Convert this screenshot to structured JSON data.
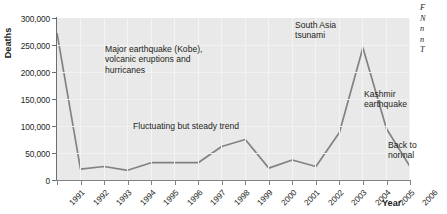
{
  "chart_data": {
    "type": "line",
    "title": "",
    "xlabel": "Year",
    "ylabel": "Deaths",
    "x": [
      1991,
      1992,
      1993,
      1994,
      1995,
      1996,
      1997,
      1998,
      1999,
      2000,
      2001,
      2002,
      2003,
      2004,
      2005,
      2006
    ],
    "categories": [
      "1991",
      "1992",
      "1993",
      "1994",
      "1995",
      "1996",
      "1997",
      "1998",
      "1999",
      "2000",
      "2001",
      "2002",
      "2003",
      "2004",
      "2005",
      "2006"
    ],
    "values": [
      272000,
      20000,
      25000,
      18000,
      32000,
      32000,
      32000,
      62000,
      75000,
      22000,
      37000,
      25000,
      88000,
      245000,
      95000,
      25000
    ],
    "ylim": [
      0,
      300000
    ],
    "yticks": [
      0,
      50000,
      100000,
      150000,
      200000,
      250000,
      300000
    ],
    "ytick_labels": [
      "0",
      "50,000",
      "100,000",
      "150,000",
      "200,000",
      "250,000",
      "300,000"
    ],
    "grid": true,
    "legend": "none",
    "series": [
      {
        "name": "Deaths",
        "color": "#808285",
        "values": [
          272000,
          20000,
          25000,
          18000,
          32000,
          32000,
          32000,
          62000,
          75000,
          22000,
          37000,
          25000,
          88000,
          245000,
          95000,
          25000
        ]
      }
    ],
    "annotations": [
      {
        "id": "kobe",
        "text": "Major earthquake (Kobe),\nvolcanic eruptions and\nhurricanes",
        "points_to": 1991
      },
      {
        "id": "fluctuating",
        "text": "Fluctuating but steady trend",
        "points_to": null
      },
      {
        "id": "tsunami",
        "text": "South Asia\ntsunami",
        "points_to": 2004
      },
      {
        "id": "kashmir",
        "text": "Kashmir\nearthquake",
        "points_to": 2005
      },
      {
        "id": "back-to-normal",
        "text": "Back to\nnormal",
        "points_to": 2006
      }
    ]
  },
  "axes": {
    "y_title": "Deaths",
    "x_title": "Year"
  },
  "side_caption": {
    "lines": [
      "F",
      "N",
      "n",
      "n",
      "T"
    ],
    "note_clipped": true
  }
}
